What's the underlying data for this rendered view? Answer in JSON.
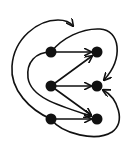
{
  "diagram": {
    "type": "directed-graph",
    "colors": {
      "stroke": "#111111",
      "background": "#ffffff"
    },
    "nodes": [
      {
        "id": "L1",
        "x": 51,
        "y": 52
      },
      {
        "id": "L2",
        "x": 51,
        "y": 86
      },
      {
        "id": "L3",
        "x": 51,
        "y": 119
      },
      {
        "id": "R1",
        "x": 97,
        "y": 52
      },
      {
        "id": "R2",
        "x": 97,
        "y": 86
      },
      {
        "id": "R3",
        "x": 97,
        "y": 119
      }
    ],
    "edges": [
      {
        "from": "L1",
        "to": "R1",
        "shape": "straight"
      },
      {
        "from": "L2",
        "to": "R1",
        "shape": "straight"
      },
      {
        "from": "L2",
        "to": "R2",
        "shape": "straight"
      },
      {
        "from": "L2",
        "to": "R3",
        "shape": "straight"
      },
      {
        "from": "L3",
        "to": "R3",
        "shape": "straight"
      },
      {
        "from": "L1",
        "to": "R2",
        "shape": "curve-over-top-right"
      },
      {
        "from": "L1",
        "to": "R3",
        "shape": "curve-inner-left"
      },
      {
        "from": "L3",
        "to": "R2",
        "shape": "curve-under-bottom-right"
      },
      {
        "from": "L3",
        "to": "top",
        "shape": "curve-outer-left-open-arrow"
      }
    ]
  }
}
